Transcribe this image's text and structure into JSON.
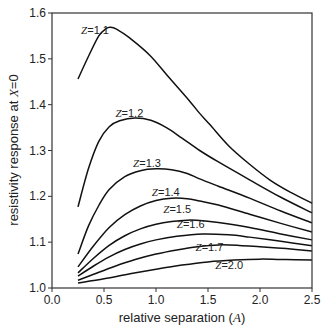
{
  "chart_data": {
    "type": "line",
    "title": "",
    "xlabel": "relative separation (A)",
    "ylabel": "resistivity response at X=0",
    "xlim": [
      0.0,
      2.5
    ],
    "ylim": [
      1.0,
      1.6
    ],
    "xticks": [
      "0.0",
      "0.5",
      "1.0",
      "1.5",
      "2.0",
      "2.5"
    ],
    "yticks": [
      "1.0",
      "1.1",
      "1.2",
      "1.3",
      "1.4",
      "1.5",
      "1.6"
    ],
    "grid": false,
    "legend": "inline labels",
    "series": [
      {
        "name": "Z=1.1",
        "label_pos": [
          0.28,
          1.555
        ],
        "x": [
          0.25,
          0.35,
          0.45,
          0.52,
          0.56,
          0.62,
          0.75,
          0.94,
          1.13,
          1.33,
          1.42,
          1.52,
          1.7,
          1.9,
          2.1,
          2.3,
          2.5
        ],
        "y": [
          1.456,
          1.505,
          1.55,
          1.566,
          1.569,
          1.565,
          1.545,
          1.508,
          1.458,
          1.406,
          1.381,
          1.356,
          1.31,
          1.27,
          1.235,
          1.208,
          1.185
        ]
      },
      {
        "name": "Z=1.2",
        "label_pos": [
          0.61,
          1.374
        ],
        "x": [
          0.25,
          0.35,
          0.45,
          0.55,
          0.65,
          0.8,
          0.95,
          1.1,
          1.25,
          1.42,
          1.6,
          1.9,
          2.2,
          2.5
        ],
        "y": [
          1.177,
          1.26,
          1.32,
          1.352,
          1.365,
          1.371,
          1.366,
          1.35,
          1.327,
          1.3,
          1.275,
          1.236,
          1.198,
          1.164
        ]
      },
      {
        "name": "Z=1.3",
        "label_pos": [
          0.78,
          1.263
        ],
        "x": [
          0.25,
          0.35,
          0.45,
          0.55,
          0.7,
          0.85,
          1.0,
          1.15,
          1.3,
          1.42,
          1.6,
          1.9,
          2.2,
          2.5
        ],
        "y": [
          1.074,
          1.135,
          1.18,
          1.215,
          1.243,
          1.256,
          1.26,
          1.258,
          1.25,
          1.238,
          1.222,
          1.196,
          1.168,
          1.142
        ]
      },
      {
        "name": "Z=1.4",
        "label_pos": [
          0.96,
          1.2
        ],
        "x": [
          0.25,
          0.4,
          0.55,
          0.7,
          0.85,
          1.0,
          1.15,
          1.3,
          1.42,
          1.6,
          1.9,
          2.2,
          2.5
        ],
        "y": [
          1.046,
          1.092,
          1.132,
          1.16,
          1.179,
          1.191,
          1.196,
          1.195,
          1.19,
          1.181,
          1.161,
          1.141,
          1.122
        ]
      },
      {
        "name": "Z=1.5",
        "label_pos": [
          1.07,
          1.163
        ],
        "x": [
          0.25,
          0.4,
          0.55,
          0.7,
          0.85,
          1.0,
          1.15,
          1.3,
          1.45,
          1.6,
          1.9,
          2.2,
          2.5
        ],
        "y": [
          1.033,
          1.065,
          1.093,
          1.114,
          1.129,
          1.139,
          1.145,
          1.148,
          1.147,
          1.143,
          1.132,
          1.118,
          1.105
        ]
      },
      {
        "name": "Z=1.6",
        "label_pos": [
          1.2,
          1.132
        ],
        "x": [
          0.25,
          0.4,
          0.55,
          0.7,
          0.85,
          1.0,
          1.2,
          1.45,
          1.7,
          1.9,
          2.2,
          2.5
        ],
        "y": [
          1.026,
          1.048,
          1.068,
          1.084,
          1.096,
          1.105,
          1.113,
          1.118,
          1.116,
          1.111,
          1.102,
          1.092
        ]
      },
      {
        "name": "Z=1.7",
        "label_pos": [
          1.38,
          1.08
        ],
        "x": [
          0.25,
          0.4,
          0.6,
          0.8,
          1.0,
          1.2,
          1.4,
          1.6,
          1.8,
          2.0,
          2.25,
          2.5
        ],
        "y": [
          1.017,
          1.03,
          1.047,
          1.062,
          1.074,
          1.083,
          1.09,
          1.094,
          1.093,
          1.09,
          1.086,
          1.081
        ]
      },
      {
        "name": "Z=2.0",
        "label_pos": [
          1.57,
          1.041
        ],
        "x": [
          0.25,
          0.5,
          0.75,
          1.0,
          1.25,
          1.5,
          1.75,
          2.0,
          2.25,
          2.5
        ],
        "y": [
          1.011,
          1.02,
          1.031,
          1.041,
          1.05,
          1.057,
          1.061,
          1.063,
          1.062,
          1.061
        ]
      }
    ]
  },
  "labels": {
    "xlabel_prefix": "relative separation (",
    "xlabel_var": "A",
    "xlabel_suffix": ")",
    "ylabel_prefix": "resistivity response at ",
    "ylabel_var": "X",
    "ylabel_suffix": "=0"
  }
}
